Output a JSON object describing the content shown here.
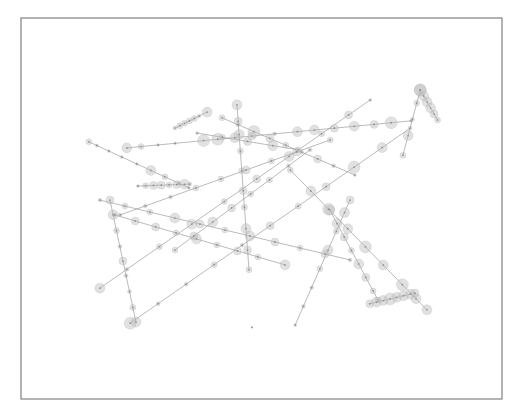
{
  "figure": {
    "title": "",
    "caption": "",
    "frame_color": "#8a8a8a",
    "line_color": "#8c8c8c",
    "node_color": "#bdbdbd",
    "coordinate_system": "normalized plot units, x from 0 (left) to 1 (right), y from 0 (top) to 1 (bottom)"
  },
  "chart_data": {
    "type": "scatter",
    "title": "",
    "xlabel": "",
    "ylabel": "",
    "xlim": [
      0,
      1
    ],
    "ylim": [
      0,
      1
    ],
    "grid": false,
    "legend": "none",
    "tracks": [
      {
        "id": "t1",
        "start": [
          0.141,
          0.325
        ],
        "end": [
          0.349,
          0.446
        ],
        "nodes": [
          [
            0.0,
            3
          ],
          [
            0.08,
            1.5
          ],
          [
            0.2,
            1.5
          ],
          [
            0.33,
            1.5
          ],
          [
            0.48,
            1.5
          ],
          [
            0.62,
            5
          ],
          [
            0.76,
            3
          ],
          [
            0.9,
            2
          ],
          [
            1.0,
            1.5
          ]
        ]
      },
      {
        "id": "t2",
        "start": [
          0.22,
          0.341
        ],
        "end": [
          0.811,
          0.27
        ],
        "nodes": [
          [
            0.0,
            5
          ],
          [
            0.05,
            3
          ],
          [
            0.11,
            1.5
          ],
          [
            0.17,
            1.5
          ],
          [
            0.27,
            6
          ],
          [
            0.32,
            6
          ],
          [
            0.38,
            5
          ],
          [
            0.44,
            4
          ],
          [
            0.52,
            2
          ],
          [
            0.6,
            5
          ],
          [
            0.66,
            5
          ],
          [
            0.73,
            4
          ],
          [
            0.8,
            5
          ],
          [
            0.87,
            4
          ],
          [
            0.93,
            6
          ],
          [
            1.0,
            1.5
          ]
        ]
      },
      {
        "id": "t3",
        "start": [
          0.32,
          0.289
        ],
        "end": [
          0.387,
          0.247
        ],
        "nodes": [
          [
            0.0,
            2
          ],
          [
            0.15,
            3
          ],
          [
            0.3,
            3
          ],
          [
            0.45,
            3
          ],
          [
            0.6,
            3
          ],
          [
            0.75,
            2
          ],
          [
            1.0,
            5
          ]
        ]
      },
      {
        "id": "t4",
        "start": [
          0.449,
          0.228
        ],
        "end": [
          0.474,
          0.661
        ],
        "nodes": [
          [
            0.0,
            5
          ],
          [
            0.1,
            4
          ],
          [
            0.18,
            5
          ],
          [
            0.28,
            3
          ],
          [
            0.4,
            3
          ],
          [
            0.52,
            4
          ],
          [
            0.62,
            3
          ],
          [
            0.75,
            5
          ],
          [
            0.88,
            4
          ],
          [
            1.0,
            3
          ]
        ]
      },
      {
        "id": "t5",
        "start": [
          0.418,
          0.262
        ],
        "end": [
          0.694,
          0.412
        ],
        "nodes": [
          [
            0.0,
            3
          ],
          [
            0.12,
            2
          ],
          [
            0.24,
            6
          ],
          [
            0.36,
            4
          ],
          [
            0.48,
            3
          ],
          [
            0.6,
            2
          ],
          [
            0.72,
            4
          ],
          [
            0.84,
            2
          ],
          [
            1.0,
            1.5
          ]
        ]
      },
      {
        "id": "t6",
        "start": [
          0.366,
          0.302
        ],
        "end": [
          0.576,
          0.346
        ],
        "nodes": [
          [
            0.0,
            1.5
          ],
          [
            0.25,
            3
          ],
          [
            0.5,
            4
          ],
          [
            0.75,
            5
          ],
          [
            1.0,
            3
          ]
        ]
      },
      {
        "id": "t7",
        "start": [
          0.164,
          0.709
        ],
        "end": [
          0.726,
          0.215
        ],
        "nodes": [
          [
            0.0,
            5
          ],
          [
            0.1,
            2
          ],
          [
            0.22,
            3
          ],
          [
            0.34,
            5
          ],
          [
            0.46,
            3
          ],
          [
            0.58,
            4
          ],
          [
            0.7,
            5
          ],
          [
            0.82,
            3
          ],
          [
            0.92,
            4
          ],
          [
            1.0,
            1.5
          ]
        ]
      },
      {
        "id": "t8",
        "start": [
          0.227,
          0.801
        ],
        "end": [
          0.809,
          0.289
        ],
        "nodes": [
          [
            0.0,
            6
          ],
          [
            0.1,
            2
          ],
          [
            0.2,
            2
          ],
          [
            0.3,
            3
          ],
          [
            0.4,
            2
          ],
          [
            0.5,
            4
          ],
          [
            0.6,
            3
          ],
          [
            0.7,
            4
          ],
          [
            0.8,
            6
          ],
          [
            0.9,
            5
          ],
          [
            1.0,
            2
          ]
        ]
      },
      {
        "id": "t9",
        "start": [
          0.185,
          0.478
        ],
        "end": [
          0.239,
          0.798
        ],
        "nodes": [
          [
            0.0,
            4
          ],
          [
            0.12,
            5
          ],
          [
            0.25,
            3
          ],
          [
            0.38,
            2
          ],
          [
            0.5,
            4
          ],
          [
            0.62,
            2
          ],
          [
            0.75,
            2
          ],
          [
            0.88,
            3
          ],
          [
            1.0,
            5
          ]
        ]
      },
      {
        "id": "t10",
        "start": [
          0.164,
          0.478
        ],
        "end": [
          0.684,
          0.635
        ],
        "nodes": [
          [
            0.0,
            2
          ],
          [
            0.1,
            3
          ],
          [
            0.2,
            3
          ],
          [
            0.3,
            5
          ],
          [
            0.4,
            4
          ],
          [
            0.5,
            3
          ],
          [
            0.6,
            5
          ],
          [
            0.7,
            4
          ],
          [
            0.8,
            3
          ],
          [
            0.9,
            4
          ],
          [
            1.0,
            2
          ]
        ]
      },
      {
        "id": "t11",
        "start": [
          0.243,
          0.441
        ],
        "end": [
          0.351,
          0.436
        ],
        "nodes": [
          [
            0.0,
            1.5
          ],
          [
            0.15,
            3
          ],
          [
            0.3,
            4
          ],
          [
            0.45,
            4
          ],
          [
            0.6,
            3
          ],
          [
            0.75,
            4
          ],
          [
            0.9,
            5
          ],
          [
            1.0,
            2
          ]
        ]
      },
      {
        "id": "t12",
        "start": [
          0.83,
          0.189
        ],
        "end": [
          0.794,
          0.36
        ],
        "nodes": [
          [
            0.0,
            6
          ],
          [
            0.2,
            3
          ],
          [
            0.45,
            2
          ],
          [
            0.7,
            5
          ],
          [
            1.0,
            3
          ]
        ]
      },
      {
        "id": "t13",
        "start": [
          0.83,
          0.189
        ],
        "end": [
          0.866,
          0.268
        ],
        "nodes": [
          [
            0.0,
            6
          ],
          [
            0.2,
            5
          ],
          [
            0.4,
            5
          ],
          [
            0.6,
            5
          ],
          [
            0.8,
            4
          ],
          [
            1.0,
            3
          ]
        ]
      },
      {
        "id": "t14",
        "start": [
          0.642,
          0.504
        ],
        "end": [
          0.742,
          0.74
        ],
        "nodes": [
          [
            0.0,
            5
          ],
          [
            0.15,
            5
          ],
          [
            0.3,
            4
          ],
          [
            0.45,
            3
          ],
          [
            0.6,
            5
          ],
          [
            0.75,
            4
          ],
          [
            0.9,
            3
          ],
          [
            1.0,
            3
          ]
        ]
      },
      {
        "id": "t15",
        "start": [
          0.56,
          0.399
        ],
        "end": [
          0.844,
          0.766
        ],
        "nodes": [
          [
            0.0,
            3
          ],
          [
            0.15,
            5
          ],
          [
            0.28,
            6
          ],
          [
            0.42,
            5
          ],
          [
            0.55,
            6
          ],
          [
            0.68,
            5
          ],
          [
            0.82,
            6
          ],
          [
            0.92,
            5
          ],
          [
            1.0,
            5
          ]
        ]
      },
      {
        "id": "t16",
        "start": [
          0.57,
          0.806
        ],
        "end": [
          0.684,
          0.478
        ],
        "nodes": [
          [
            0.0,
            1.5
          ],
          [
            0.15,
            2
          ],
          [
            0.3,
            2
          ],
          [
            0.45,
            3
          ],
          [
            0.6,
            5
          ],
          [
            0.75,
            3
          ],
          [
            0.9,
            5
          ],
          [
            1.0,
            4
          ]
        ]
      },
      {
        "id": "t17",
        "start": [
          0.725,
          0.75
        ],
        "end": [
          0.819,
          0.722
        ],
        "nodes": [
          [
            0.0,
            4
          ],
          [
            0.15,
            5
          ],
          [
            0.3,
            5
          ],
          [
            0.45,
            6
          ],
          [
            0.6,
            5
          ],
          [
            0.75,
            5
          ],
          [
            0.9,
            5
          ],
          [
            1.0,
            4
          ]
        ]
      },
      {
        "id": "t18",
        "start": [
          0.195,
          0.517
        ],
        "end": [
          0.549,
          0.648
        ],
        "nodes": [
          [
            0.0,
            2
          ],
          [
            0.12,
            4
          ],
          [
            0.24,
            4
          ],
          [
            0.36,
            3
          ],
          [
            0.48,
            5
          ],
          [
            0.6,
            3
          ],
          [
            0.72,
            4
          ],
          [
            0.84,
            3
          ],
          [
            1.0,
            5
          ]
        ]
      },
      {
        "id": "t19",
        "start": [
          0.206,
          0.517
        ],
        "end": [
          0.643,
          0.32
        ],
        "nodes": [
          [
            0.0,
            2
          ],
          [
            0.12,
            2
          ],
          [
            0.24,
            2
          ],
          [
            0.36,
            3
          ],
          [
            0.48,
            3
          ],
          [
            0.6,
            4
          ],
          [
            0.72,
            3
          ],
          [
            0.84,
            4
          ],
          [
            1.0,
            3
          ]
        ]
      },
      {
        "id": "t20",
        "start": [
          0.32,
          0.609
        ],
        "end": [
          0.601,
          0.346
        ],
        "nodes": [
          [
            0.0,
            3
          ],
          [
            0.14,
            4
          ],
          [
            0.28,
            5
          ],
          [
            0.42,
            4
          ],
          [
            0.56,
            3
          ],
          [
            0.7,
            3
          ],
          [
            0.84,
            2
          ],
          [
            1.0,
            2
          ]
        ]
      },
      {
        "id": "t21",
        "start": [
          0.48,
          0.812
        ],
        "end": [
          0.48,
          0.812
        ],
        "nodes": [
          [
            0.0,
            1
          ]
        ]
      }
    ]
  }
}
